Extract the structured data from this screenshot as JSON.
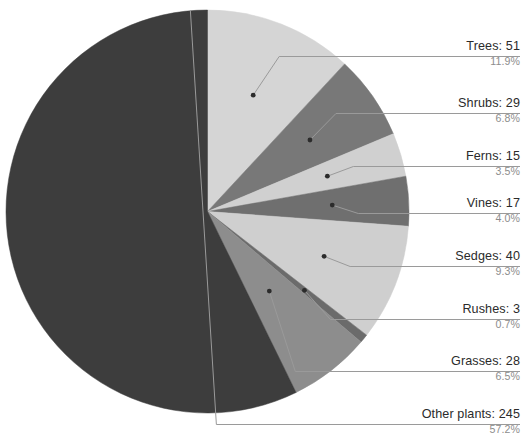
{
  "chart_data": {
    "type": "pie",
    "title": "",
    "subtitle": "",
    "xlabel": "",
    "ylabel": "",
    "legend_position": "callout-labels-right",
    "grid": false,
    "total": 428,
    "categories": [
      "Trees",
      "Shrubs",
      "Ferns",
      "Vines",
      "Sedges",
      "Rushes",
      "Grasses",
      "Other plants"
    ],
    "values": [
      51,
      29,
      15,
      17,
      40,
      3,
      28,
      245
    ],
    "percentages": [
      11.9,
      6.8,
      3.5,
      4.0,
      9.3,
      0.7,
      6.5,
      57.2
    ],
    "colors": [
      "#d5d5d5",
      "#787878",
      "#d0d0d0",
      "#6f6f6f",
      "#cfcfcf",
      "#6b6b6b",
      "#8d8d8d",
      "#3d3d3d"
    ],
    "start_angle_deg": 0,
    "direction": "clockwise"
  },
  "slices": [
    {
      "name": "Trees",
      "label": "Trees: 51",
      "percent_label": "11.9%",
      "value": 51,
      "percent": 11.9,
      "color": "#d5d5d5"
    },
    {
      "name": "Shrubs",
      "label": "Shrubs: 29",
      "percent_label": "6.8%",
      "value": 29,
      "percent": 6.8,
      "color": "#787878"
    },
    {
      "name": "Ferns",
      "label": "Ferns: 15",
      "percent_label": "3.5%",
      "value": 15,
      "percent": 3.5,
      "color": "#d0d0d0"
    },
    {
      "name": "Vines",
      "label": "Vines: 17",
      "percent_label": "4.0%",
      "value": 17,
      "percent": 4.0,
      "color": "#6f6f6f"
    },
    {
      "name": "Sedges",
      "label": "Sedges: 40",
      "percent_label": "9.3%",
      "value": 40,
      "percent": 9.3,
      "color": "#cfcfcf"
    },
    {
      "name": "Rushes",
      "label": "Rushes: 3",
      "percent_label": "0.7%",
      "value": 3,
      "percent": 0.7,
      "color": "#6b6b6b"
    },
    {
      "name": "Grasses",
      "label": "Grasses: 28",
      "percent_label": "6.5%",
      "value": 28,
      "percent": 6.5,
      "color": "#8d8d8d"
    },
    {
      "name": "Other plants",
      "label": "Other plants: 245",
      "percent_label": "57.2%",
      "value": 245,
      "percent": 57.2,
      "color": "#3d3d3d"
    }
  ],
  "style": {
    "background": "#ffffff",
    "label_color": "#2b2b2b",
    "percent_color": "#8d8d8d",
    "leader_color": "#9a9a9a",
    "leader_dot_color": "#2b2b2b"
  }
}
